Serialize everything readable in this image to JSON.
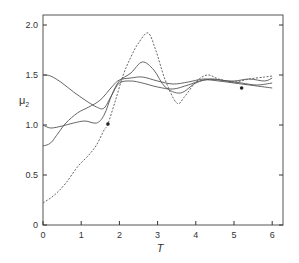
{
  "chart_data": {
    "type": "line",
    "title": "",
    "xlabel": "T",
    "ylabel": "μ2",
    "xlim": [
      0,
      6.2
    ],
    "ylim": [
      0,
      2.1
    ],
    "xticks": [
      0,
      1,
      2,
      3,
      4,
      5,
      6
    ],
    "xtick_labels": [
      "0",
      "1",
      "2",
      "3",
      "4",
      "5",
      "6"
    ],
    "yticks": [
      0,
      0.5,
      1.0,
      1.5,
      2.0
    ],
    "ytick_labels": [
      "0",
      "0.5",
      "1.0",
      "1.5",
      "2.0"
    ],
    "grid": false,
    "legend": false,
    "series": [
      {
        "name": "curve-start-1.5",
        "style": "solid",
        "x": [
          0,
          0.2,
          0.5,
          0.8,
          1.1,
          1.4,
          1.6,
          1.8,
          2.0,
          2.3,
          2.6,
          3.0,
          3.4,
          3.8,
          4.2,
          4.6,
          5.0,
          5.4,
          5.8,
          6.0
        ],
        "y": [
          1.5,
          1.49,
          1.42,
          1.33,
          1.25,
          1.18,
          1.17,
          1.3,
          1.42,
          1.44,
          1.42,
          1.38,
          1.36,
          1.4,
          1.45,
          1.44,
          1.42,
          1.4,
          1.38,
          1.37
        ]
      },
      {
        "name": "curve-start-1.0",
        "style": "solid",
        "x": [
          0,
          0.2,
          0.5,
          0.8,
          1.1,
          1.4,
          1.6,
          1.8,
          2.0,
          2.3,
          2.6,
          2.9,
          3.2,
          3.6,
          4.0,
          4.4,
          4.8,
          5.2,
          5.6,
          6.0
        ],
        "y": [
          1.0,
          0.97,
          0.99,
          1.02,
          1.04,
          1.02,
          1.1,
          1.3,
          1.44,
          1.52,
          1.63,
          1.55,
          1.38,
          1.32,
          1.42,
          1.46,
          1.44,
          1.42,
          1.4,
          1.42
        ]
      },
      {
        "name": "curve-start-0.8",
        "style": "solid",
        "x": [
          0,
          0.2,
          0.4,
          0.6,
          0.9,
          1.2,
          1.5,
          1.8,
          2.0,
          2.3,
          2.6,
          3.0,
          3.4,
          3.8,
          4.2,
          4.6,
          5.0,
          5.4,
          5.8,
          6.0
        ],
        "y": [
          0.79,
          0.82,
          0.92,
          1.02,
          1.12,
          1.18,
          1.25,
          1.38,
          1.45,
          1.47,
          1.48,
          1.44,
          1.41,
          1.43,
          1.46,
          1.45,
          1.44,
          1.46,
          1.44,
          1.47
        ]
      },
      {
        "name": "curve-dashed-start-0.22",
        "style": "dashed",
        "x": [
          0,
          0.3,
          0.6,
          0.9,
          1.2,
          1.4,
          1.6,
          1.7,
          1.9,
          2.1,
          2.3,
          2.5,
          2.75,
          2.95,
          3.2,
          3.5,
          3.7,
          4.0,
          4.3,
          4.6,
          5.0,
          5.4,
          5.8,
          6.0
        ],
        "y": [
          0.22,
          0.3,
          0.42,
          0.58,
          0.7,
          0.8,
          0.95,
          1.01,
          1.25,
          1.5,
          1.68,
          1.82,
          1.92,
          1.75,
          1.45,
          1.22,
          1.28,
          1.43,
          1.5,
          1.46,
          1.43,
          1.46,
          1.48,
          1.49
        ]
      }
    ],
    "annotations": [
      {
        "type": "marker",
        "shape": "dot",
        "x": 1.7,
        "y": 1.01
      },
      {
        "type": "marker",
        "shape": "dot",
        "x": 5.2,
        "y": 1.37
      }
    ]
  },
  "colors": {
    "line": "#555555",
    "axis": "#333333",
    "background": "#ffffff"
  }
}
